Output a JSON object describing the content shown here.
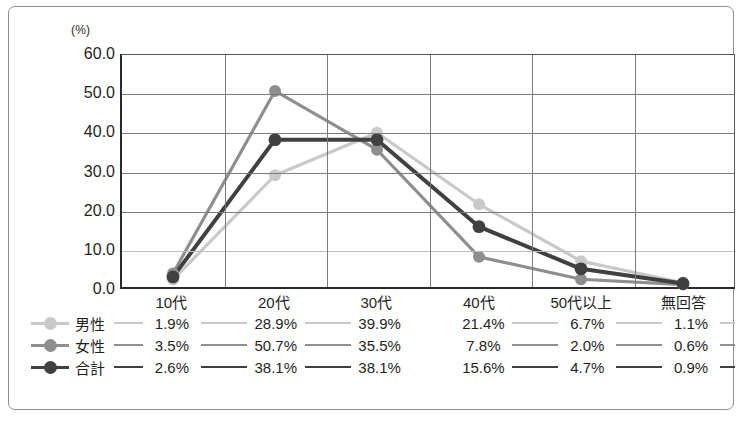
{
  "unit_label": "(%)",
  "chart_data": {
    "type": "line",
    "title": "",
    "xlabel": "",
    "ylabel": "(%)",
    "ylim": [
      0.0,
      60.0
    ],
    "yticks": [
      "0.0",
      "10.0",
      "20.0",
      "30.0",
      "40.0",
      "50.0",
      "60.0"
    ],
    "ytick_values": [
      0.0,
      10.0,
      20.0,
      30.0,
      40.0,
      50.0,
      60.0
    ],
    "grid": true,
    "legend_position": "bottom-table",
    "categories": [
      "10代",
      "20代",
      "30代",
      "40代",
      "50代以上",
      "無回答"
    ],
    "series": [
      {
        "name": "男性",
        "color": "#c9c9c9",
        "values": [
          1.9,
          28.9,
          39.9,
          21.4,
          6.7,
          1.1
        ],
        "labels": [
          "1.9%",
          "28.9%",
          "39.9%",
          "21.4%",
          "6.7%",
          "1.1%"
        ]
      },
      {
        "name": "女性",
        "color": "#8e8e8e",
        "values": [
          3.5,
          50.7,
          35.5,
          7.8,
          2.0,
          0.6
        ],
        "labels": [
          "3.5%",
          "50.7%",
          "35.5%",
          "7.8%",
          "2.0%",
          "0.6%"
        ]
      },
      {
        "name": "合計",
        "color": "#404040",
        "values": [
          2.6,
          38.1,
          38.1,
          15.6,
          4.7,
          0.9
        ],
        "labels": [
          "2.6%",
          "38.1%",
          "38.1%",
          "15.6%",
          "4.7%",
          "0.9%"
        ]
      }
    ]
  }
}
